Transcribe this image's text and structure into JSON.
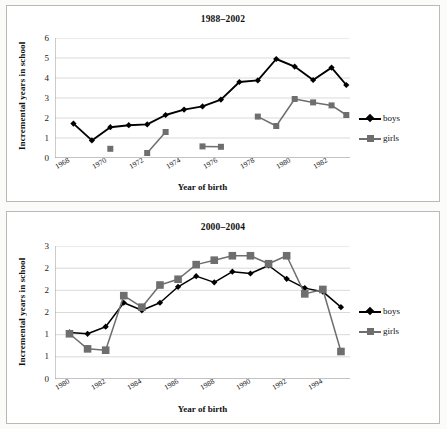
{
  "figure": {
    "background": "#fbfbfa",
    "panel_border": "#b9b9b9"
  },
  "colors": {
    "boys": "#000000",
    "girls": "#6e6e6e",
    "gridline": "#cfcfcf",
    "axis": "#9a9a9a"
  },
  "legend": {
    "boys_label": "boys",
    "girls_label": "girls",
    "position": "right"
  },
  "chart_data": [
    {
      "type": "line",
      "title": "1988–2002",
      "xlabel": "Year of birth",
      "ylabel": "Incremental years in school",
      "xlim": [
        1967.5,
        1983.5
      ],
      "ylim": [
        0,
        6
      ],
      "yticks": [
        0,
        1,
        2,
        3,
        4,
        5,
        6
      ],
      "ytick_labels": [
        "0",
        "1",
        "2",
        "3",
        "4",
        "5",
        "6"
      ],
      "xticks": [
        1968,
        1970,
        1972,
        1974,
        1976,
        1978,
        1980,
        1982
      ],
      "xtick_labels": [
        "1968",
        "1970",
        "1972",
        "1974",
        "1976",
        "1978",
        "1980",
        "1982"
      ],
      "grid": "horizontal",
      "legend_position": "right",
      "series": [
        {
          "name": "boys",
          "color": "#000000",
          "marker": "diamond",
          "x": [
            1968.5,
            1969.5,
            1970.5,
            1971.5,
            1972.5,
            1973.5,
            1974.5,
            1975.5,
            1976.5,
            1977.5,
            1978.5,
            1979.5,
            1980.5,
            1981.5,
            1982.5,
            1983.3
          ],
          "values": [
            1.72,
            0.88,
            1.54,
            1.64,
            1.68,
            2.15,
            2.42,
            2.58,
            2.92,
            3.8,
            3.88,
            4.95,
            4.57,
            3.9,
            4.52,
            3.65
          ]
        },
        {
          "name": "girls",
          "color": "#6e6e6e",
          "marker": "square",
          "segments": [
            {
              "x": [
                1970.5
              ],
              "values": [
                0.46
              ]
            },
            {
              "x": [
                1972.5,
                1973.5
              ],
              "values": [
                0.25,
                1.3
              ]
            },
            {
              "x": [
                1975.5,
                1976.5
              ],
              "values": [
                0.58,
                0.56
              ]
            },
            {
              "x": [
                1978.5,
                1979.5,
                1980.5,
                1981.5,
                1982.5,
                1983.3
              ],
              "values": [
                2.07,
                1.6,
                2.95,
                2.78,
                2.63,
                2.15
              ]
            }
          ]
        }
      ]
    },
    {
      "type": "line",
      "title": "2000–2004",
      "xlabel": "Year of birth",
      "ylabel": "Incremental years in school",
      "xlim": [
        1979.5,
        1995.8
      ],
      "ylim": [
        0,
        3
      ],
      "yticks": [
        0,
        0.5,
        1,
        1.5,
        2,
        2.5,
        3
      ],
      "ytick_labels": [
        "0",
        "1",
        "1",
        "2",
        "2",
        "3"
      ],
      "ytick_label_note": "axis labels are displayed truncated to whole numbers at 0.5 steps",
      "xticks": [
        1980,
        1982,
        1984,
        1986,
        1988,
        1990,
        1992,
        1994
      ],
      "xtick_labels": [
        "1980",
        "1982",
        "1984",
        "1986",
        "1988",
        "1990",
        "1992",
        "1994"
      ],
      "grid": "horizontal",
      "legend_position": "right",
      "series": [
        {
          "name": "boys",
          "color": "#000000",
          "marker": "diamond",
          "x": [
            1980.3,
            1981.3,
            1982.3,
            1983.3,
            1984.3,
            1985.3,
            1986.3,
            1987.3,
            1988.3,
            1989.3,
            1990.3,
            1991.3,
            1992.3,
            1993.3,
            1994.3,
            1995.3
          ],
          "values": [
            1.05,
            1.02,
            1.18,
            1.72,
            1.55,
            1.72,
            2.08,
            2.32,
            2.18,
            2.42,
            2.38,
            2.56,
            2.26,
            2.05,
            1.97,
            1.62
          ]
        },
        {
          "name": "girls",
          "color": "#6e6e6e",
          "marker": "square",
          "x": [
            1980.3,
            1981.3,
            1982.3,
            1983.3,
            1984.3,
            1985.3,
            1986.3,
            1987.3,
            1988.3,
            1989.3,
            1990.3,
            1991.3,
            1992.3,
            1993.3,
            1994.3,
            1995.3
          ],
          "values": [
            1.02,
            0.68,
            0.65,
            1.88,
            1.62,
            2.12,
            2.25,
            2.58,
            2.68,
            2.78,
            2.78,
            2.6,
            2.78,
            1.92,
            2.02,
            0.62
          ]
        }
      ]
    }
  ]
}
